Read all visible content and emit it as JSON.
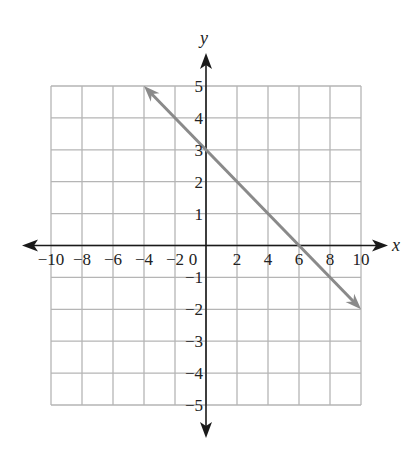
{
  "chart_data": {
    "type": "line",
    "title": "",
    "xlabel": "x",
    "ylabel": "y",
    "xlim": [
      -10,
      10
    ],
    "ylim": [
      -5,
      5
    ],
    "grid": true,
    "x_grid_step": 2,
    "y_grid_step": 1,
    "x_tick_labels": [
      "-10",
      "-8",
      "-6",
      "-4",
      "-2",
      "0",
      "2",
      "4",
      "6",
      "8",
      "10"
    ],
    "y_tick_labels": [
      "5",
      "4",
      "3",
      "2",
      "1",
      "-1",
      "-2",
      "-3",
      "-4",
      "-5"
    ],
    "series": [
      {
        "name": "line",
        "equation": "y = -x/2 + 3",
        "x": [
          -4,
          10
        ],
        "y": [
          5,
          -2
        ],
        "arrows": "both",
        "color": "#8a8a8a"
      }
    ],
    "intercepts": {
      "x_intercept": 6,
      "y_intercept": 3
    }
  },
  "colors": {
    "grid": "#b5b5b5",
    "axis": "#1a1a1a",
    "line": "#8a8a8a"
  }
}
